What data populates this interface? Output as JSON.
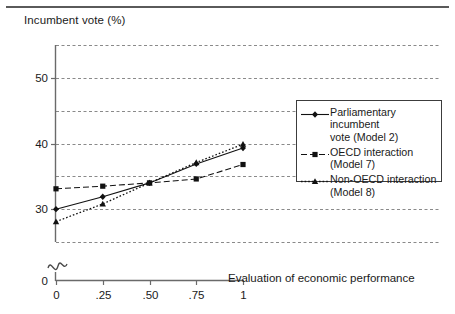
{
  "figure": {
    "y_axis_title": "Incumbent vote (%)",
    "x_axis_title": "Evaluation of\neconomic performance"
  },
  "legend": {
    "entries": [
      {
        "label": "Parliamentary incumbent\nvote (Model 2)",
        "marker": "diamond-marker",
        "style": "solid"
      },
      {
        "label": "OECD interaction\n(Model 7)",
        "marker": "square-marker",
        "style": "dashed"
      },
      {
        "label": "Non-OECD interaction\n(Model 8)",
        "marker": "triangle-marker",
        "style": "dotted"
      }
    ]
  },
  "chart_data": {
    "type": "line",
    "title": "",
    "xlabel": "Evaluation of economic performance",
    "ylabel": "Incumbent vote (%)",
    "x": [
      0,
      0.25,
      0.5,
      0.75,
      1
    ],
    "xtick_labels": [
      "0",
      ".25",
      ".50",
      ".75",
      "1"
    ],
    "ytick_labels": [
      "0",
      "30",
      "40",
      "50"
    ],
    "ytick_values": [
      0,
      30,
      40,
      50
    ],
    "gridlines": [
      25,
      30,
      35,
      40,
      45,
      50,
      55
    ],
    "ylim": [
      25,
      55
    ],
    "xlim": [
      0,
      1
    ],
    "axis_break": true,
    "grid": "horizontal-dashed",
    "legend_position": "right",
    "series": [
      {
        "name": "Parliamentary incumbent vote (Model 2)",
        "model": "Model 2",
        "marker": "diamond",
        "style": "solid",
        "values": [
          30.0,
          31.9,
          34.0,
          36.9,
          39.3
        ]
      },
      {
        "name": "OECD interaction (Model 7)",
        "model": "Model 7",
        "marker": "square",
        "style": "dashed",
        "values": [
          33.1,
          33.5,
          34.0,
          34.6,
          36.8
        ]
      },
      {
        "name": "Non-OECD interaction (Model 8)",
        "model": "Model 8",
        "marker": "triangle",
        "style": "dotted",
        "values": [
          28.1,
          30.8,
          34.0,
          37.1,
          39.9
        ]
      }
    ]
  }
}
